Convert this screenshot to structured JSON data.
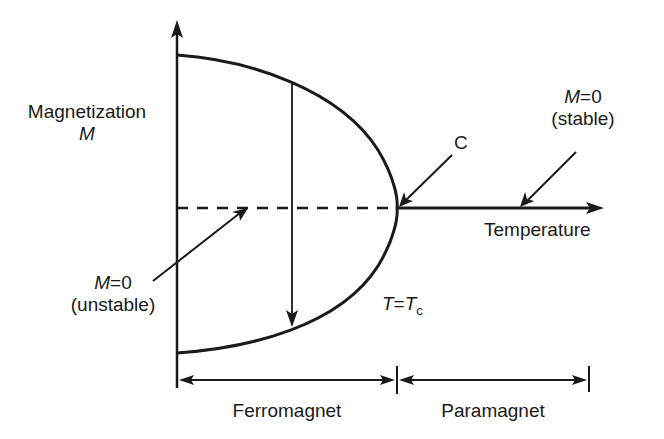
{
  "diagram": {
    "y_axis": {
      "label_line1": "Magnetization",
      "label_line2": "M"
    },
    "x_axis": {
      "label": "Temperature"
    },
    "critical_point": {
      "label": "C",
      "condition_lhs": "T",
      "condition_eq": "=",
      "condition_rhs": "T",
      "condition_sub": "c"
    },
    "stable_branch": {
      "line1_var": "M",
      "line1_rest": "=0",
      "line2": "(stable)"
    },
    "unstable_branch": {
      "line1_var": "M",
      "line1_rest": "=0",
      "line2": "(unstable)"
    },
    "regions": [
      {
        "label": "Ferromagnet"
      },
      {
        "label": "Paramagnet"
      }
    ],
    "colors": {
      "ink": "#1a1a1a",
      "background": "#ffffff"
    }
  }
}
